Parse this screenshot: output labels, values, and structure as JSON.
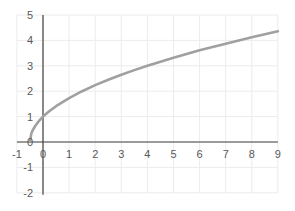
{
  "chart_data": {
    "type": "line",
    "title": "",
    "xlabel": "",
    "ylabel": "",
    "xlim": [
      -1,
      9
    ],
    "ylim": [
      -2,
      5
    ],
    "grid": true,
    "legend": null,
    "x_ticks": [
      -1,
      0,
      1,
      2,
      3,
      4,
      5,
      6,
      7,
      8,
      9
    ],
    "y_ticks": [
      -2,
      -1,
      0,
      1,
      2,
      3,
      4,
      5
    ],
    "series": [
      {
        "name": "y = sqrt(2x + 1)",
        "x": [
          -0.5,
          -0.45,
          -0.4,
          -0.3,
          -0.2,
          -0.1,
          0,
          0.25,
          0.5,
          1,
          1.5,
          2,
          2.5,
          3,
          3.5,
          4,
          4.5,
          5,
          5.5,
          6,
          6.5,
          7,
          7.5,
          8,
          8.5,
          9
        ],
        "values": [
          0,
          0.32,
          0.45,
          0.63,
          0.77,
          0.89,
          1,
          1.22,
          1.41,
          1.73,
          2,
          2.24,
          2.45,
          2.65,
          2.83,
          3,
          3.16,
          3.32,
          3.46,
          3.61,
          3.74,
          3.87,
          4,
          4.12,
          4.24,
          4.36
        ],
        "color": "#a0a0a0"
      }
    ]
  },
  "colors": {
    "axis": "#404040",
    "grid": "#ececec",
    "curve": "#a0a0a0",
    "label": "#595959"
  }
}
